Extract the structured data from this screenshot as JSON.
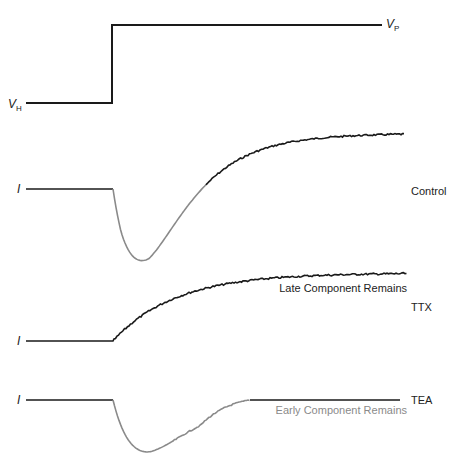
{
  "figure": {
    "type": "voltage-clamp current traces",
    "voltage_trace": {
      "holding_label": "V",
      "holding_sub": "H",
      "step_label": "V",
      "step_sub": "P"
    },
    "traces": [
      {
        "id": "control",
        "axis_label": "I",
        "condition": "Control",
        "annotation": "",
        "early_color": "#8a8a8a",
        "late_color": "#1a1a1a",
        "components": [
          "early inward (downward)",
          "late outward (upward)"
        ]
      },
      {
        "id": "ttx",
        "axis_label": "I",
        "condition": "TTX",
        "annotation": "Late Component Remains",
        "late_color": "#1a1a1a",
        "components": [
          "late outward (upward)"
        ]
      },
      {
        "id": "tea",
        "axis_label": "I",
        "condition": "TEA",
        "annotation": "Early Component Remains",
        "early_color": "#8a8a8a",
        "annotation_color": "#8a8a8a",
        "components": [
          "early inward (downward)"
        ]
      }
    ]
  },
  "colors": {
    "line": "#1a1a1a",
    "early_component": "#8a8a8a",
    "background": "#ffffff"
  }
}
